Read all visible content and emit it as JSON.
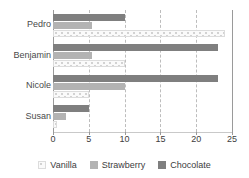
{
  "chart_data": {
    "type": "bar",
    "orientation": "horizontal",
    "title": "",
    "xlabel": "",
    "ylabel": "",
    "categories": [
      "Pedro",
      "Benjamin",
      "Nicole",
      "Susan"
    ],
    "series": [
      {
        "name": "Vanilla",
        "color": "#fafafa",
        "values": [
          24,
          10,
          5,
          0.5
        ]
      },
      {
        "name": "Strawberry",
        "color": "#b3b3b3",
        "values": [
          5.5,
          5.5,
          10,
          1.8
        ]
      },
      {
        "name": "Chocolate",
        "color": "#7f7f7f",
        "values": [
          10,
          23,
          23,
          5
        ]
      }
    ],
    "series_draw_order": [
      "Chocolate",
      "Strawberry",
      "Vanilla"
    ],
    "xlim": [
      0,
      25
    ],
    "xticks": [
      0,
      5,
      10,
      15,
      20,
      25
    ],
    "xtick_labels": [
      "0",
      "5",
      "10",
      "15",
      "20",
      "25"
    ],
    "gridlines": [
      5,
      10,
      15,
      20
    ],
    "grid": true,
    "legend_position": "bottom"
  },
  "legend": {
    "items": [
      {
        "label": "Vanilla",
        "key": "vanilla"
      },
      {
        "label": "Strawberry",
        "key": "strawberry"
      },
      {
        "label": "Chocolate",
        "key": "chocolate"
      }
    ]
  }
}
